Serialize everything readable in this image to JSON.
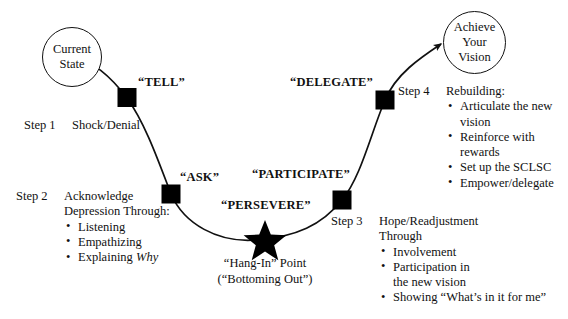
{
  "diagram": {
    "stroke_color": "#111111",
    "node_fill": "#000000",
    "background": "#ffffff"
  },
  "start_circle": {
    "name": "current-state-circle",
    "line1": "Current",
    "line2": "State"
  },
  "end_circle": {
    "name": "achieve-your-vision-circle",
    "line1": "Achieve",
    "line2": "Your",
    "line3": "Vision"
  },
  "curve_labels": {
    "tell": "“TELL”",
    "ask": "“ASK”",
    "persevere": "“PERSEVERE”",
    "participate": "“PARTICIPATE”",
    "delegate": "“DELEGATE”"
  },
  "star_caption": {
    "line1": "“Hang-In” Point",
    "line2": "(“Bottoming Out”)"
  },
  "steps": [
    {
      "id": "step-1",
      "tag": "Step 1",
      "heading": "Shock/Denial",
      "subheading": "",
      "bullets": []
    },
    {
      "id": "step-2",
      "tag": "Step 2",
      "heading": "Acknowledge",
      "subheading": "Depression Through:",
      "bullets": [
        "Listening",
        "Empathizing",
        "Explaining Why"
      ]
    },
    {
      "id": "step-3",
      "tag": "Step 3",
      "heading": "Hope/Readjustment",
      "subheading": "Through",
      "bullets": [
        "Involvement",
        "Participation in",
        "the new vision",
        "Showing “What’s in it for me”"
      ]
    },
    {
      "id": "step-4",
      "tag": "Step 4",
      "heading": "Rebuilding:",
      "subheading": "",
      "bullets": [
        "Articulate the new",
        "vision",
        "Reinforce with",
        "rewards",
        "Set up the SCLSC",
        "Empower/delegate"
      ]
    }
  ],
  "step2": {
    "tag": "Step 2",
    "heading": "Acknowledge",
    "subheading": "Depression Through:",
    "b1": "Listening",
    "b2": "Empathizing",
    "b3a": "Explaining ",
    "b3b": "Why"
  },
  "step3": {
    "tag": "Step 3",
    "heading": "Hope/Readjustment",
    "subheading": "Through",
    "b1": "Involvement",
    "b2": "Participation in",
    "b2c": "the new vision",
    "b3": "Showing “What’s in it for me”"
  },
  "step4": {
    "tag": "Step 4",
    "heading": "Rebuilding:",
    "b1": "Articulate the new",
    "b1c": "vision",
    "b2": "Reinforce with",
    "b2c": "rewards",
    "b3": "Set up the SCLSC",
    "b4": "Empower/delegate"
  },
  "step1": {
    "tag": "Step 1",
    "heading": "Shock/Denial"
  }
}
